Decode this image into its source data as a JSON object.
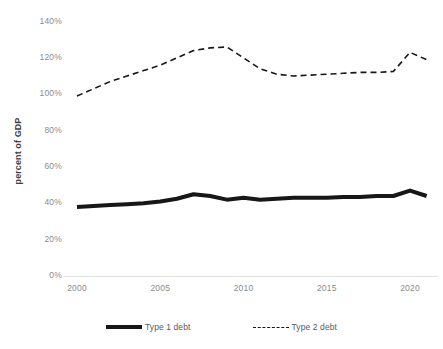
{
  "chart_data": {
    "type": "line",
    "title": "",
    "xlabel": "",
    "ylabel": "percent of GDP",
    "xlim": [
      2000,
      2021
    ],
    "ylim": [
      0,
      140
    ],
    "grid": false,
    "legend_position": "bottom",
    "x": [
      2000,
      2001,
      2002,
      2003,
      2004,
      2005,
      2006,
      2007,
      2008,
      2009,
      2010,
      2011,
      2012,
      2013,
      2014,
      2015,
      2016,
      2017,
      2018,
      2019,
      2020,
      2021
    ],
    "xtick_labels": [
      "2000",
      "2005",
      "2010",
      "2015",
      "2020"
    ],
    "xticks": [
      2000,
      2005,
      2010,
      2015,
      2020
    ],
    "ytick_labels": [
      "0%",
      "20%",
      "40%",
      "60%",
      "80%",
      "100%",
      "120%",
      "140%"
    ],
    "yticks": [
      0,
      20,
      40,
      60,
      80,
      100,
      120,
      140
    ],
    "series": [
      {
        "name": "Type 1 debt",
        "style": "solid",
        "color": "#171717",
        "width": 4,
        "values": [
          38,
          38.5,
          39,
          39.5,
          40,
          41,
          42.5,
          45,
          44,
          42,
          43,
          42,
          42.5,
          43,
          43,
          43,
          43.5,
          43.5,
          44,
          44,
          47,
          44
        ]
      },
      {
        "name": "Type 2 debt",
        "style": "dashed",
        "color": "#171717",
        "width": 1.6,
        "values": [
          99,
          103,
          107,
          110,
          113,
          116,
          120,
          124,
          125.5,
          126,
          120,
          114,
          111,
          110,
          110.5,
          111,
          111.5,
          112,
          112,
          112.5,
          123,
          119
        ]
      }
    ]
  },
  "axis": {
    "y_title": "percent of GDP"
  },
  "legend": {
    "items": [
      {
        "label": "Type 1 debt",
        "marker": "solid-line-swatch"
      },
      {
        "label": "Type 2 debt",
        "marker": "dashed-line-swatch"
      }
    ]
  }
}
